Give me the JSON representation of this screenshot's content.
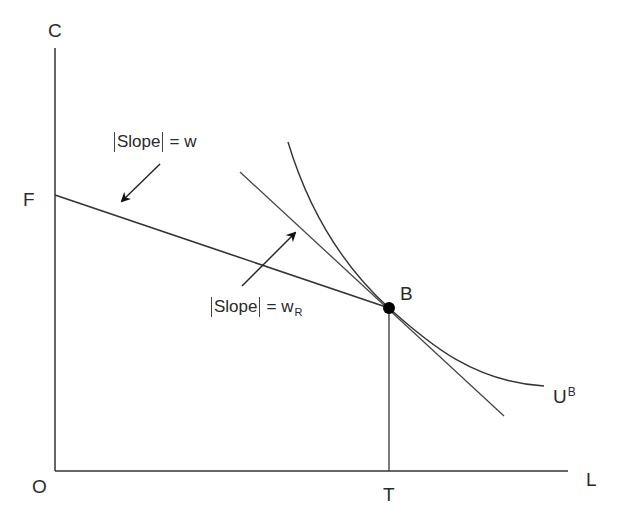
{
  "diagram": {
    "type": "labor-leisure consumption choice diagram",
    "axes": {
      "y_label": "C",
      "x_label": "L",
      "origin_label": "O"
    },
    "points": {
      "F": {
        "label": "F"
      },
      "B": {
        "label": "B"
      },
      "T": {
        "label": "T"
      }
    },
    "curves": {
      "indifference_curve": {
        "label_main": "U",
        "label_sup": "B"
      }
    },
    "annotations": {
      "budget_slope": {
        "text": "Slope",
        "equals": "=",
        "value": "w",
        "value_sub": ""
      },
      "reservation_slope": {
        "text": "Slope",
        "equals": "=",
        "value": "w",
        "value_sub": "R"
      }
    },
    "colors": {
      "line": "#333333",
      "text": "#2a2a2a",
      "point": "#000000",
      "background": "#ffffff"
    }
  }
}
